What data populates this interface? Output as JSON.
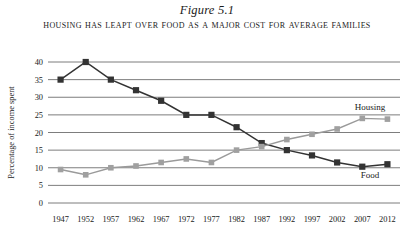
{
  "figure": {
    "number": "Figure 5.1",
    "title": "Housing Has Leapt over Food as a Major Cost for Average Families"
  },
  "chart_data": {
    "type": "line",
    "title": "Housing Has Leapt over Food as a Major Cost for Average Families",
    "xlabel": "",
    "ylabel": "Percentage of income spent",
    "categories": [
      1947,
      1952,
      1957,
      1962,
      1967,
      1972,
      1977,
      1982,
      1987,
      1992,
      1997,
      2002,
      2007,
      2012
    ],
    "xtick_labels": [
      "1947",
      "1952",
      "1957",
      "1962",
      "1967",
      "1972",
      "1977",
      "1982",
      "1987",
      "1992",
      "1997",
      "2002",
      "2007",
      "2012"
    ],
    "ytick_labels": [
      "0",
      "5",
      "10",
      "15",
      "20",
      "25",
      "30",
      "35",
      "40"
    ],
    "yticks": [
      0,
      5,
      10,
      15,
      20,
      25,
      30,
      35,
      40
    ],
    "ylim": [
      0,
      40
    ],
    "grid": true,
    "legend_position": "inline-right",
    "series": [
      {
        "name": "Food",
        "color": "#333333",
        "label_x": 2009,
        "label_y": 7.2,
        "values": [
          35,
          40,
          35,
          32,
          29,
          25,
          25,
          21.5,
          17,
          15,
          13.5,
          11.5,
          10.3,
          11
        ]
      },
      {
        "name": "Housing",
        "color": "#a0a0a0",
        "label_x": 2005,
        "label_y": 26.5,
        "values": [
          9.5,
          8,
          10,
          10.5,
          11.5,
          12.5,
          11.5,
          15,
          16,
          18,
          19.5,
          21,
          24,
          23.8
        ]
      }
    ]
  }
}
